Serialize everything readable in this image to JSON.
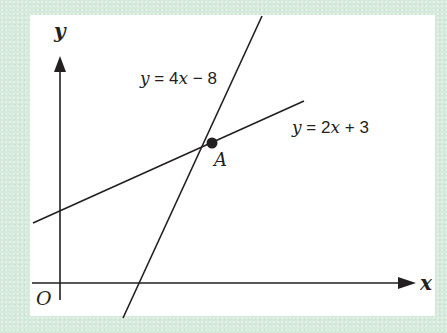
{
  "diagram": {
    "type": "coordinate-geometry",
    "colors": {
      "background": "#d6eadb",
      "panel": "#ffffff",
      "ink": "#231f20"
    },
    "axes": {
      "x_label": "x",
      "y_label": "y",
      "origin_label": "O"
    },
    "lines": [
      {
        "label": "y = 4x − 8",
        "label_var": "y",
        "label_eq": " = 4",
        "label_var2": "x",
        "label_rest": " − 8",
        "equation": {
          "m": 4,
          "c": -8
        }
      },
      {
        "label": "y = 2x + 3",
        "label_var": "y",
        "label_eq": " = 2",
        "label_var2": "x",
        "label_rest": " + 3",
        "equation": {
          "m": 2,
          "c": 3
        }
      }
    ],
    "points": [
      {
        "label": "A",
        "description": "intersection of y = 4x − 8 and y = 2x + 3"
      }
    ]
  }
}
